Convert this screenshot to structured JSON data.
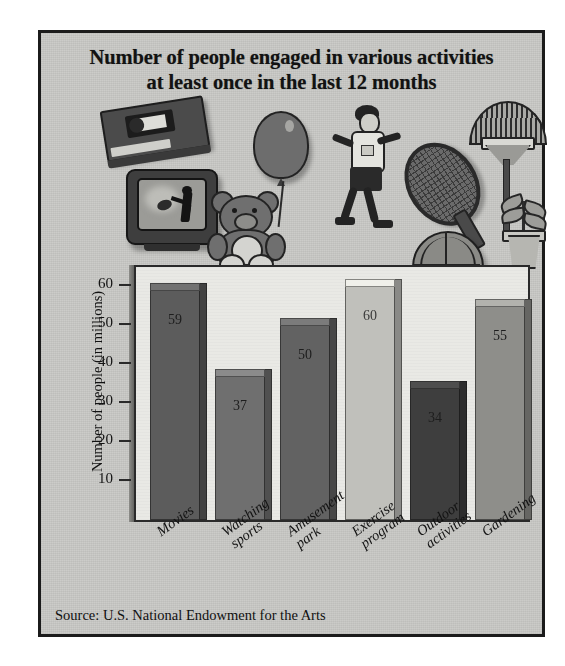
{
  "figure": {
    "title_line1": "Number of people engaged in various activities",
    "title_line2": "at least once in the last 12 months",
    "source": "Source: U.S. National Endowment for the Arts",
    "frame_color": "#1b1b1b",
    "background_color": "#c9c9c6",
    "plot_background_color": "#e9e9e5"
  },
  "illustrations": [
    {
      "name": "vhs-tape-icon",
      "depicts": "VHS video cassette tape"
    },
    {
      "name": "television-icon",
      "depicts": "Television showing a football player"
    },
    {
      "name": "balloon-icon",
      "depicts": "Balloon on a string"
    },
    {
      "name": "teddy-bear-icon",
      "depicts": "Teddy bear holding balloon"
    },
    {
      "name": "jogger-icon",
      "depicts": "Person jogging / exercising"
    },
    {
      "name": "tennis-racket-icon",
      "depicts": "Tennis racket"
    },
    {
      "name": "basketball-icon",
      "depicts": "Basketball"
    },
    {
      "name": "rake-icon",
      "depicts": "Garden leaf rake"
    },
    {
      "name": "potted-plant-icon",
      "depicts": "Potted plant"
    }
  ],
  "chart_data": {
    "type": "bar",
    "title": "Number of people engaged in various activities at least once in the last 12 months",
    "xlabel": "",
    "ylabel": "Number of people (in millions)",
    "ylim": [
      0,
      65
    ],
    "yticks": [
      10,
      20,
      30,
      40,
      50,
      60
    ],
    "grid": false,
    "legend": null,
    "categories": [
      "Movies",
      "Watching sports",
      "Amusement park",
      "Exercise program",
      "Outdoor activities",
      "Gardening"
    ],
    "category_lines": [
      [
        "Movies"
      ],
      [
        "Watching",
        "sports"
      ],
      [
        "Amusement",
        "park"
      ],
      [
        "Exercise",
        "program"
      ],
      [
        "Outdoor",
        "activities"
      ],
      [
        "Gardening"
      ]
    ],
    "values": [
      59,
      37,
      50,
      60,
      34,
      55
    ],
    "value_labels": [
      "59",
      "37",
      "50",
      "60",
      "34",
      "55"
    ],
    "bar_colors": [
      "#5c5c5c",
      "#6f6f6f",
      "#626262",
      "#c0c0bb",
      "#3e3e3e",
      "#8e8e8a"
    ],
    "source": "Source: U.S. National Endowment for the Arts"
  }
}
